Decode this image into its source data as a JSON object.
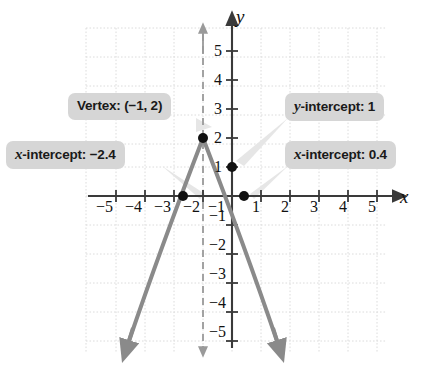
{
  "figure": {
    "axis_label_x": "x",
    "axis_label_y": "y"
  },
  "callouts": {
    "vertex": {
      "prefix": "Vertex: ",
      "value": "(−1, 2)"
    },
    "y_intercept": {
      "var": "y",
      "rest": "-intercept: 1"
    },
    "x_intercept_left": {
      "var": "x",
      "rest": "-intercept: −2.4"
    },
    "x_intercept_right": {
      "var": "x",
      "rest": "-intercept: 0.4"
    }
  },
  "colors": {
    "curve": "#8a8a8a",
    "axis": "#3a3a3a",
    "grid": "#dcdcdc",
    "callout_bg": "#d6d6d6",
    "point": "#111111",
    "leader": "#e2e2e2",
    "symmetry_line": "#9a9a9a"
  },
  "chart_data": {
    "type": "line",
    "title": "",
    "xlabel": "x",
    "ylabel": "y",
    "xlim": [
      -5.8,
      5.8
    ],
    "ylim": [
      -5.8,
      5.8
    ],
    "grid": true,
    "legend": "none",
    "equation": "y = -(x + 1)^2 + 2",
    "x_ticks": [
      -5,
      -4,
      -3,
      -2,
      -1,
      1,
      2,
      3,
      4,
      5
    ],
    "x_tick_labels": [
      "−5",
      "−4",
      "−3",
      "−2",
      "−1",
      "1",
      "2",
      "3",
      "4",
      "5"
    ],
    "y_ticks": [
      5,
      4,
      3,
      2,
      1,
      -1,
      -2,
      -3,
      -4,
      -5
    ],
    "y_tick_labels": [
      "5",
      "4",
      "3",
      "2",
      "1",
      "−1",
      "−2",
      "−3",
      "−4",
      "−5"
    ],
    "series": [
      {
        "name": "parabola",
        "type": "parabola",
        "vertex": [
          -1,
          2
        ],
        "direction": "down",
        "x": [
          -3.8,
          -3.4,
          -3.0,
          -2.6,
          -2.4,
          -2.0,
          -1.6,
          -1.2,
          -1.0,
          -0.8,
          -0.4,
          0.0,
          0.4,
          0.6,
          1.0,
          1.4,
          1.8
        ],
        "values": [
          -5.84,
          -3.76,
          -2.0,
          -0.56,
          0.04,
          1.0,
          1.64,
          1.96,
          2.0,
          1.96,
          1.64,
          1.0,
          0.04,
          -0.56,
          -2.0,
          -3.76,
          -5.84
        ]
      }
    ],
    "annotations": [
      {
        "name": "vertex",
        "point": [
          -1,
          2
        ],
        "label": "Vertex: (−1, 2)"
      },
      {
        "name": "y-intercept",
        "point": [
          0,
          1
        ],
        "label": "y-intercept: 1"
      },
      {
        "name": "x-intercept-left",
        "point": [
          -2.4,
          0
        ],
        "label": "x-intercept: −2.4"
      },
      {
        "name": "x-intercept-right",
        "point": [
          0.4,
          0
        ],
        "label": "x-intercept: 0.4"
      }
    ],
    "axis_of_symmetry": {
      "x": -1,
      "style": "dashed"
    }
  },
  "ticks": {
    "x": [
      {
        "label": "−5",
        "left": 96,
        "top": 199
      },
      {
        "label": "−4",
        "left": 125,
        "top": 199
      },
      {
        "label": "−3",
        "left": 154,
        "top": 199
      },
      {
        "label": "−2",
        "left": 183,
        "top": 199
      },
      {
        "label": "−1",
        "left": 208,
        "top": 199
      },
      {
        "label": "1",
        "left": 252,
        "top": 199
      },
      {
        "label": "2",
        "left": 281,
        "top": 199
      },
      {
        "label": "3",
        "left": 310,
        "top": 199
      },
      {
        "label": "4",
        "left": 339,
        "top": 199
      },
      {
        "label": "5",
        "left": 368,
        "top": 199
      }
    ],
    "y": [
      {
        "label": "5",
        "left": 214,
        "top": 43
      },
      {
        "label": "4",
        "left": 214,
        "top": 72
      },
      {
        "label": "3",
        "left": 214,
        "top": 101
      },
      {
        "label": "2",
        "left": 214,
        "top": 130
      },
      {
        "label": "1",
        "left": 214,
        "top": 159
      },
      {
        "label": "−1",
        "left": 209,
        "top": 208
      },
      {
        "label": "−2",
        "left": 209,
        "top": 237
      },
      {
        "label": "−3",
        "left": 209,
        "top": 266
      },
      {
        "label": "−4",
        "left": 209,
        "top": 295
      },
      {
        "label": "−5",
        "left": 209,
        "top": 324
      }
    ]
  }
}
